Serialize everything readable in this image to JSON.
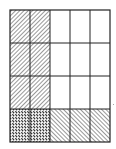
{
  "diagram": {
    "type": "fraction-area-model",
    "columns": 5,
    "rows": 4,
    "grid": {
      "left": 10,
      "top": 10,
      "width": 100,
      "height": 132
    },
    "colors": {
      "line": "#222222",
      "background": "#ffffff"
    },
    "cells": [
      [
        "hatch-forward",
        "hatch-forward",
        "empty",
        "empty",
        "empty"
      ],
      [
        "hatch-forward",
        "hatch-forward",
        "empty",
        "empty",
        "empty"
      ],
      [
        "hatch-forward",
        "hatch-forward",
        "empty",
        "empty",
        "empty"
      ],
      [
        "cross-hatch",
        "cross-hatch",
        "hatch-back",
        "hatch-back",
        "hatch-back"
      ]
    ],
    "legend": {
      "hatch-forward": "columns 1–2 shading (2/5)",
      "hatch-back": "bottom row shading (1/4)",
      "cross-hatch": "overlap (2/20)"
    }
  }
}
